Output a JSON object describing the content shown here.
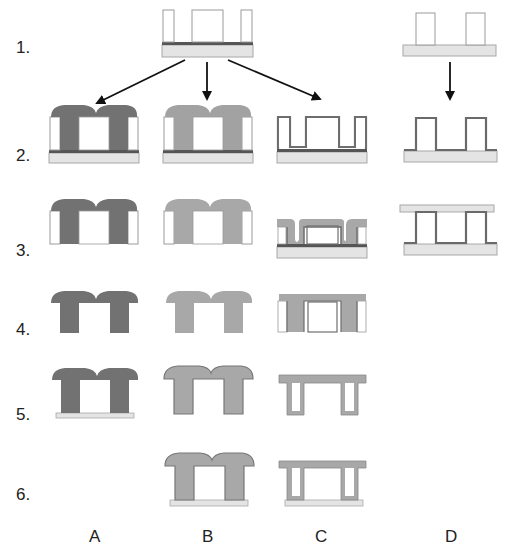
{
  "colors": {
    "background": "#ffffff",
    "substrate": "#e4e4e4",
    "substrate_stroke": "#a8a8a8",
    "seed_layer": "#555555",
    "mold_fill": "#ffffff",
    "mold_stroke": "#9a9a9a",
    "material_A": "#727272",
    "material_B": "#a2a2a2",
    "material_C": "#a8a8a8",
    "liner_C": "#6e6e6e",
    "material_D": "#6a6a6a",
    "arrow": "#111111",
    "text": "#222222"
  },
  "row_labels": [
    {
      "text": "1.",
      "x": 16,
      "y": 43
    },
    {
      "text": "2.",
      "x": 16,
      "y": 160
    },
    {
      "text": "3.",
      "x": 16,
      "y": 255
    },
    {
      "text": "4.",
      "x": 16,
      "y": 334
    },
    {
      "text": "5.",
      "x": 16,
      "y": 419
    },
    {
      "text": "6.",
      "x": 16,
      "y": 500
    }
  ],
  "column_labels": [
    {
      "text": "A",
      "x": 89,
      "y": 529
    },
    {
      "text": "B",
      "x": 202,
      "y": 529
    },
    {
      "text": "C",
      "x": 315,
      "y": 529
    },
    {
      "text": "D",
      "x": 444,
      "y": 529
    }
  ],
  "arrows": [
    {
      "from": [
        185,
        60
      ],
      "to": [
        95,
        104
      ],
      "target": "A"
    },
    {
      "from": [
        207,
        62
      ],
      "to": [
        207,
        98
      ],
      "target": "B"
    },
    {
      "from": [
        228,
        60
      ],
      "to": [
        320,
        100
      ],
      "target": "C"
    },
    {
      "from": [
        450,
        62
      ],
      "to": [
        450,
        100
      ],
      "target": "D"
    }
  ],
  "steps": {
    "row1_start": {
      "type": "mold_on_seed",
      "x": 162,
      "top": 10,
      "seed_y": 43,
      "bottom": 57,
      "width": 91
    },
    "row1_D": {
      "type": "posts_on_substrate",
      "x": 403,
      "top": 12,
      "base_y": 45,
      "bottom": 56,
      "width": 93
    },
    "row2_A": {
      "type": "overplated_mushroom",
      "column": "A",
      "x": 49,
      "top": 105,
      "seed_y": 150,
      "bottom": 163,
      "material": "material_A"
    },
    "row2_B": {
      "type": "overplated_mushroom",
      "column": "B",
      "x": 163,
      "top": 105,
      "seed_y": 150,
      "bottom": 163,
      "material": "material_B"
    },
    "row2_C": {
      "type": "conformal_liner",
      "column": "C",
      "x": 277,
      "top": 117,
      "seed_y": 149,
      "bottom": 163
    },
    "row2_D": {
      "type": "coated_posts",
      "column": "D",
      "x": 404,
      "top": 118,
      "base_y": 150,
      "bottom": 162
    },
    "row3_A": {
      "type": "mushroom_in_mold_no_base",
      "column": "A",
      "x": 49,
      "top": 199,
      "bottom": 244,
      "material": "material_A"
    },
    "row3_B": {
      "type": "mushroom_in_mold_no_base",
      "column": "B",
      "x": 163,
      "top": 199,
      "bottom": 244,
      "material": "material_B"
    },
    "row3_C": {
      "type": "conformal_fill",
      "column": "C",
      "x": 277,
      "top": 219,
      "seed_y": 246,
      "bottom": 258
    },
    "row3_D": {
      "type": "bonded_lid",
      "column": "D",
      "x": 404,
      "lid_top": 205,
      "lid_bottom": 212,
      "base_y": 243,
      "bottom": 255
    },
    "row4_A": {
      "type": "released_mushroom",
      "column": "A",
      "x": 50,
      "top": 291,
      "bottom": 333,
      "material": "material_A"
    },
    "row4_B": {
      "type": "released_mushroom",
      "column": "B",
      "x": 165,
      "top": 291,
      "bottom": 333,
      "material": "material_B"
    },
    "row4_C": {
      "type": "conformal_in_mold",
      "column": "C",
      "x": 277,
      "top": 293,
      "bottom": 332
    },
    "row5_A": {
      "type": "mushroom_on_plate",
      "column": "A",
      "x": 50,
      "top": 368,
      "plate_y": 414,
      "bottom": 419,
      "material": "material_A"
    },
    "row5_B": {
      "type": "outlined_mushroom",
      "column": "B",
      "x": 163,
      "top": 366,
      "bottom": 414,
      "material": "material_B"
    },
    "row5_C": {
      "type": "free_conformal",
      "column": "C",
      "x": 278,
      "top": 375,
      "bottom": 415
    },
    "row6_B": {
      "type": "mushroom_on_plate_outlined",
      "column": "B",
      "x": 163,
      "top": 453,
      "plate_y": 500,
      "bottom": 506,
      "material": "material_B"
    },
    "row6_C": {
      "type": "conformal_on_plate",
      "column": "C",
      "x": 278,
      "top": 460,
      "plate_y": 500,
      "bottom": 506
    }
  }
}
